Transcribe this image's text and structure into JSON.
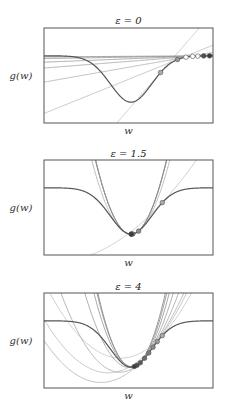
{
  "chart_data": [
    {
      "type": "line",
      "title": "ε = 0",
      "title_prefix": "ε",
      "title_value": "0",
      "xlabel": "w",
      "ylabel": "g(w)",
      "function": "g(w) = 1 - exp(-((w - 0.03)^2)/0.12)",
      "xlim": [
        -1,
        1
      ],
      "ylim": [
        -0.45,
        1.6
      ],
      "epsilon": 0,
      "iterates_w": [
        0.38,
        0.58,
        0.68,
        0.76,
        0.82,
        0.89,
        0.96
      ],
      "grid": false,
      "legend": "none"
    },
    {
      "type": "line",
      "title": "ε = 1.5",
      "title_prefix": "ε",
      "title_value": "1.5",
      "xlabel": "w",
      "ylabel": "g(w)",
      "function": "g(w) = 1 - exp(-((w - 0.03)^2)/0.12)",
      "xlim": [
        -1,
        1
      ],
      "ylim": [
        -0.45,
        1.6
      ],
      "epsilon": 1.5,
      "iterates_w": [
        0.4,
        0.12,
        0.05,
        0.035,
        0.032
      ],
      "grid": false,
      "legend": "none"
    },
    {
      "type": "line",
      "title": "ε = 4",
      "title_prefix": "ε",
      "title_value": "4",
      "xlabel": "w",
      "ylabel": "g(w)",
      "function": "g(w) = 1 - exp(-((w - 0.03)^2)/0.12)",
      "xlim": [
        -1,
        1
      ],
      "ylim": [
        -0.45,
        1.6
      ],
      "epsilon": 4,
      "iterates_w": [
        0.4,
        0.34,
        0.29,
        0.24,
        0.19,
        0.14,
        0.1,
        0.07
      ],
      "grid": false,
      "legend": "none"
    }
  ]
}
